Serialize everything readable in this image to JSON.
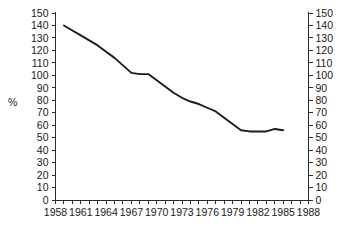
{
  "chart_data": {
    "type": "line",
    "title": "",
    "subtitle": "",
    "xlabel": "",
    "ylabel": "%",
    "ylabel_right": "",
    "xlim": [
      1958,
      1988
    ],
    "ylim": [
      0,
      150
    ],
    "grid": false,
    "legend": false,
    "legend_position": "none",
    "y_ticks": [
      0,
      10,
      20,
      30,
      40,
      50,
      60,
      70,
      80,
      90,
      100,
      110,
      120,
      130,
      140,
      150
    ],
    "y_tick_labels": [
      "0",
      "10",
      "20",
      "30",
      "40",
      "50",
      "60",
      "70",
      "80",
      "90",
      "100",
      "110",
      "120",
      "130",
      "140",
      "150"
    ],
    "y_ticks_right": [
      0,
      10,
      20,
      30,
      40,
      50,
      60,
      70,
      80,
      90,
      100,
      110,
      120,
      130,
      140,
      150
    ],
    "y_tick_labels_right": [
      "0",
      "10",
      "20",
      "30",
      "40",
      "50",
      "60",
      "70",
      "80",
      "90",
      "100",
      "110",
      "120",
      "130",
      "140",
      "150"
    ],
    "x_ticks": [
      1958,
      1959,
      1960,
      1961,
      1962,
      1963,
      1964,
      1965,
      1966,
      1967,
      1968,
      1969,
      1970,
      1971,
      1972,
      1973,
      1974,
      1975,
      1976,
      1977,
      1978,
      1979,
      1980,
      1981,
      1982,
      1983,
      1984,
      1985,
      1986,
      1987,
      1988
    ],
    "x_tick_labels": [
      "1958",
      "",
      "",
      "1961",
      "",
      "",
      "1964",
      "",
      "",
      "1967",
      "",
      "",
      "1970",
      "",
      "",
      "1973",
      "",
      "",
      "1976",
      "",
      "",
      "1979",
      "",
      "",
      "1982",
      "",
      "",
      "1985",
      "",
      "",
      "1988"
    ],
    "x_major_labels": [
      "1958",
      "1961",
      "1964",
      "1967",
      "1970",
      "1973",
      "1976",
      "1979",
      "1982",
      "1985",
      "1988"
    ],
    "series": [
      {
        "name": "percent",
        "color": "#1c1c1c",
        "x": [
          1959,
          1960,
          1961,
          1962,
          1963,
          1964,
          1965,
          1966,
          1967,
          1968,
          1969,
          1970,
          1971,
          1972,
          1973,
          1974,
          1975,
          1976,
          1977,
          1978,
          1979,
          1980,
          1981,
          1982,
          1983,
          1984,
          1985
        ],
        "values": [
          140,
          136,
          132,
          128,
          124,
          119,
          114,
          108,
          102,
          101,
          101,
          96,
          91,
          86,
          82,
          79,
          77,
          74,
          71,
          66,
          61,
          56,
          55,
          55,
          55,
          57,
          56
        ]
      }
    ]
  }
}
